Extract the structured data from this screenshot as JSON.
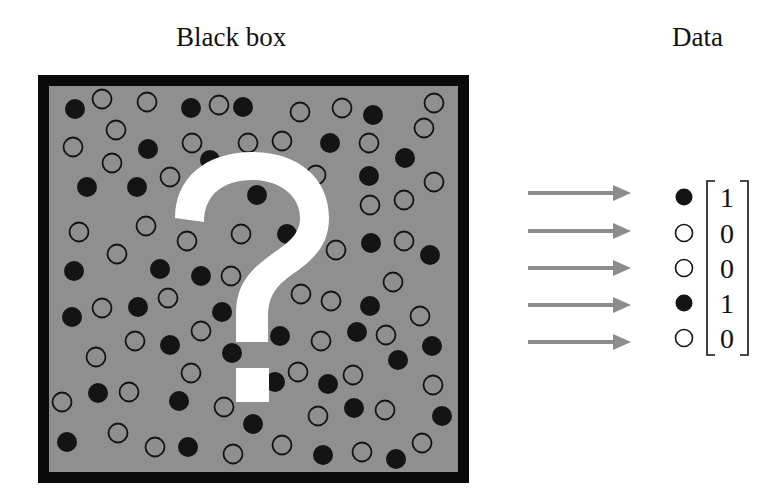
{
  "titles": {
    "black_box": "Black box",
    "data": "Data"
  },
  "colors": {
    "box_border": "#0a0a0a",
    "box_fill": "#8f8f8f",
    "filled_dot": "#141414",
    "open_dot_stroke": "#141414",
    "open_dot_fill_inside_box": "#8f8f8f",
    "question_mark": "#ffffff",
    "arrow": "#8c8c8c",
    "text": "#111111"
  },
  "black_box": {
    "question_mark_icon": "question-mark",
    "particles": [
      {
        "x": 75,
        "y": 109,
        "f": 1
      },
      {
        "x": 102,
        "y": 99,
        "f": 0
      },
      {
        "x": 147,
        "y": 102,
        "f": 0
      },
      {
        "x": 191,
        "y": 108,
        "f": 1
      },
      {
        "x": 219,
        "y": 105,
        "f": 0
      },
      {
        "x": 243,
        "y": 107,
        "f": 1
      },
      {
        "x": 300,
        "y": 112,
        "f": 0
      },
      {
        "x": 342,
        "y": 108,
        "f": 0
      },
      {
        "x": 373,
        "y": 115,
        "f": 1
      },
      {
        "x": 434,
        "y": 103,
        "f": 0
      },
      {
        "x": 116,
        "y": 130,
        "f": 0
      },
      {
        "x": 73,
        "y": 147,
        "f": 0
      },
      {
        "x": 148,
        "y": 149,
        "f": 1
      },
      {
        "x": 192,
        "y": 143,
        "f": 0
      },
      {
        "x": 248,
        "y": 143,
        "f": 0
      },
      {
        "x": 282,
        "y": 141,
        "f": 0
      },
      {
        "x": 330,
        "y": 143,
        "f": 1
      },
      {
        "x": 369,
        "y": 143,
        "f": 0
      },
      {
        "x": 424,
        "y": 128,
        "f": 0
      },
      {
        "x": 112,
        "y": 163,
        "f": 0
      },
      {
        "x": 170,
        "y": 177,
        "f": 0
      },
      {
        "x": 87,
        "y": 187,
        "f": 1
      },
      {
        "x": 137,
        "y": 187,
        "f": 1
      },
      {
        "x": 405,
        "y": 158,
        "f": 1
      },
      {
        "x": 316,
        "y": 175,
        "f": 0
      },
      {
        "x": 369,
        "y": 176,
        "f": 1
      },
      {
        "x": 434,
        "y": 182,
        "f": 0
      },
      {
        "x": 257,
        "y": 195,
        "f": 1
      },
      {
        "x": 370,
        "y": 205,
        "f": 0
      },
      {
        "x": 404,
        "y": 200,
        "f": 0
      },
      {
        "x": 210,
        "y": 160,
        "f": 1
      },
      {
        "x": 79,
        "y": 232,
        "f": 0
      },
      {
        "x": 146,
        "y": 226,
        "f": 0
      },
      {
        "x": 187,
        "y": 241,
        "f": 0
      },
      {
        "x": 241,
        "y": 234,
        "f": 0
      },
      {
        "x": 117,
        "y": 254,
        "f": 0
      },
      {
        "x": 74,
        "y": 271,
        "f": 1
      },
      {
        "x": 160,
        "y": 269,
        "f": 1
      },
      {
        "x": 201,
        "y": 276,
        "f": 1
      },
      {
        "x": 231,
        "y": 276,
        "f": 0
      },
      {
        "x": 287,
        "y": 234,
        "f": 1
      },
      {
        "x": 336,
        "y": 250,
        "f": 0
      },
      {
        "x": 371,
        "y": 243,
        "f": 1
      },
      {
        "x": 404,
        "y": 241,
        "f": 0
      },
      {
        "x": 430,
        "y": 255,
        "f": 1
      },
      {
        "x": 393,
        "y": 282,
        "f": 0
      },
      {
        "x": 301,
        "y": 294,
        "f": 0
      },
      {
        "x": 331,
        "y": 301,
        "f": 0
      },
      {
        "x": 370,
        "y": 306,
        "f": 1
      },
      {
        "x": 168,
        "y": 298,
        "f": 0
      },
      {
        "x": 72,
        "y": 317,
        "f": 1
      },
      {
        "x": 102,
        "y": 308,
        "f": 0
      },
      {
        "x": 138,
        "y": 307,
        "f": 1
      },
      {
        "x": 222,
        "y": 312,
        "f": 1
      },
      {
        "x": 201,
        "y": 331,
        "f": 0
      },
      {
        "x": 135,
        "y": 341,
        "f": 0
      },
      {
        "x": 170,
        "y": 345,
        "f": 1
      },
      {
        "x": 420,
        "y": 316,
        "f": 0
      },
      {
        "x": 357,
        "y": 332,
        "f": 1
      },
      {
        "x": 386,
        "y": 335,
        "f": 0
      },
      {
        "x": 280,
        "y": 336,
        "f": 1
      },
      {
        "x": 321,
        "y": 341,
        "f": 0
      },
      {
        "x": 432,
        "y": 346,
        "f": 1
      },
      {
        "x": 96,
        "y": 357,
        "f": 0
      },
      {
        "x": 232,
        "y": 353,
        "f": 1
      },
      {
        "x": 191,
        "y": 373,
        "f": 0
      },
      {
        "x": 398,
        "y": 360,
        "f": 1
      },
      {
        "x": 298,
        "y": 372,
        "f": 0
      },
      {
        "x": 275,
        "y": 382,
        "f": 1
      },
      {
        "x": 328,
        "y": 384,
        "f": 1
      },
      {
        "x": 353,
        "y": 375,
        "f": 0
      },
      {
        "x": 433,
        "y": 385,
        "f": 0
      },
      {
        "x": 98,
        "y": 393,
        "f": 1
      },
      {
        "x": 129,
        "y": 392,
        "f": 0
      },
      {
        "x": 179,
        "y": 401,
        "f": 1
      },
      {
        "x": 62,
        "y": 402,
        "f": 0
      },
      {
        "x": 224,
        "y": 407,
        "f": 0
      },
      {
        "x": 318,
        "y": 416,
        "f": 0
      },
      {
        "x": 354,
        "y": 408,
        "f": 1
      },
      {
        "x": 385,
        "y": 410,
        "f": 0
      },
      {
        "x": 442,
        "y": 416,
        "f": 1
      },
      {
        "x": 253,
        "y": 424,
        "f": 1
      },
      {
        "x": 118,
        "y": 433,
        "f": 0
      },
      {
        "x": 67,
        "y": 442,
        "f": 1
      },
      {
        "x": 155,
        "y": 447,
        "f": 0
      },
      {
        "x": 188,
        "y": 447,
        "f": 1
      },
      {
        "x": 233,
        "y": 454,
        "f": 0
      },
      {
        "x": 282,
        "y": 445,
        "f": 0
      },
      {
        "x": 323,
        "y": 455,
        "f": 1
      },
      {
        "x": 362,
        "y": 452,
        "f": 0
      },
      {
        "x": 396,
        "y": 459,
        "f": 1
      },
      {
        "x": 422,
        "y": 443,
        "f": 0
      }
    ]
  },
  "arrows": [
    {
      "y": 193
    },
    {
      "y": 231
    },
    {
      "y": 268
    },
    {
      "y": 305
    },
    {
      "y": 342
    }
  ],
  "data_vector": {
    "entries": [
      {
        "symbol": "filled-dot",
        "value": "1"
      },
      {
        "symbol": "open-dot",
        "value": "0"
      },
      {
        "symbol": "open-dot",
        "value": "0"
      },
      {
        "symbol": "filled-dot",
        "value": "1"
      },
      {
        "symbol": "open-dot",
        "value": "0"
      }
    ]
  }
}
